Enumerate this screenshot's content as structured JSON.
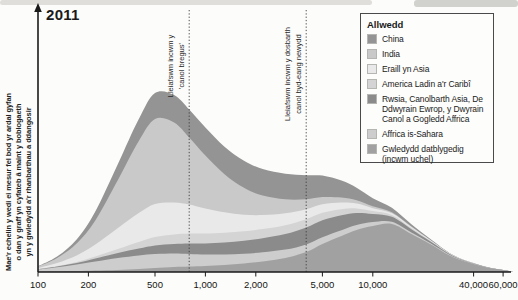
{
  "page": {
    "year_label": "2011"
  },
  "y_axis_note": {
    "lines": [
      "Mae'r echelin y wedi ei mesur fel bod yr ardal gyfan",
      "o dan y graff yn cyfateb â maint y boblogaeth",
      "yn y gwledydd a'r rhanbarthau a ddangosir"
    ]
  },
  "annotations": [
    {
      "lines": [
        "Lleiafswm incwm y",
        "'canol bregus'"
      ],
      "x_value": 800
    },
    {
      "lines": [
        "Lleiafswm incwm y dosbarth",
        "canol byd-eang newydd"
      ],
      "x_value": 4000
    }
  ],
  "legend": {
    "title": "Allwedd",
    "items": [
      {
        "label": "China",
        "color": "#949494"
      },
      {
        "label": "India",
        "color": "#c9c9c9"
      },
      {
        "label": "Eraill yn Asia",
        "color": "#e9e9e9"
      },
      {
        "label": "America Ladin a'r Caribî",
        "color": "#d4d4d4"
      },
      {
        "label": "Rwsia, Canolbarth Asia, De Ddwyrain Ewrop, y Dwyrain Canol a Gogledd Affrica",
        "color": "#8b8b8b"
      },
      {
        "label": "Affrica is-Sahara",
        "color": "#cdcdcd"
      },
      {
        "label": "Gwledydd datblygedig (incwm uchel)",
        "color": "#a1a1a1"
      }
    ]
  },
  "chart_data": {
    "type": "area",
    "stacked": true,
    "stack_order": "bottom-to-top",
    "title": "2011",
    "x_scale": "log",
    "x_range": [
      100,
      70000
    ],
    "legend_position": "top-right",
    "grid": false,
    "x_ticks": {
      "values": [
        100,
        200,
        500,
        1000,
        2000,
        5000,
        10000,
        40000,
        60000
      ],
      "labels": [
        "100",
        "200",
        "500",
        "1,000",
        "2,000",
        "5,000",
        "10,000",
        "40,000",
        "60,000"
      ]
    },
    "threshold_values": [
      800,
      4000
    ],
    "x": [
      100,
      130,
      170,
      220,
      300,
      400,
      500,
      650,
      800,
      1000,
      1300,
      1700,
      2200,
      3000,
      4000,
      5000,
      6500,
      8000,
      10000,
      13000,
      17000,
      22000,
      30000,
      40000,
      50000,
      60000,
      70000
    ],
    "series": [
      {
        "name": "Gwledydd datblygedig (incwm uchel)",
        "color": "#a1a1a1",
        "values": [
          0.5,
          0.8,
          1,
          1.5,
          2,
          3,
          4,
          5,
          5.5,
          6,
          7,
          8.5,
          10.5,
          14,
          20,
          28,
          36,
          42,
          46,
          48,
          38,
          28,
          15,
          8,
          4,
          2,
          0
        ]
      },
      {
        "name": "Affrica is-Sahara",
        "color": "#cdcdcd",
        "values": [
          2,
          4,
          6.5,
          9,
          12,
          13.5,
          14,
          13.5,
          12.5,
          11.5,
          10.5,
          9.8,
          9.2,
          8.4,
          7.6,
          6.8,
          5.8,
          5,
          4,
          2.2,
          1.6,
          1,
          0.5,
          0.2,
          0.1,
          0,
          0
        ]
      },
      {
        "name": "Rwsia, Canolbarth Asia, De Ddwyrain Ewrop, y Dwyrain Canol a Gogledd Affrica",
        "color": "#8b8b8b",
        "values": [
          0.3,
          0.7,
          1.5,
          3,
          5,
          7,
          8.5,
          9.5,
          10.5,
          11,
          12,
          13,
          14,
          15.5,
          17,
          17,
          15,
          12,
          8,
          5,
          3.2,
          1.8,
          0.8,
          0.3,
          0.1,
          0,
          0
        ]
      },
      {
        "name": "America Ladin a'r Caribî",
        "color": "#d4d4d4",
        "values": [
          0.2,
          0.5,
          1,
          2,
          4,
          6.5,
          8.5,
          9.5,
          10,
          10,
          9.8,
          9.5,
          9.2,
          8.8,
          8.2,
          7.4,
          6,
          4.6,
          3,
          1.8,
          1.1,
          0.6,
          0.25,
          0.1,
          0,
          0,
          0
        ]
      },
      {
        "name": "Eraill yn Asia",
        "color": "#e9e9e9",
        "values": [
          1,
          3,
          6.5,
          12,
          21,
          29,
          33,
          32,
          29,
          25,
          20.5,
          16.5,
          14,
          12,
          10,
          8.5,
          6.6,
          4.8,
          2.8,
          1.8,
          1.1,
          0.6,
          0.25,
          0.1,
          0,
          0,
          0
        ]
      },
      {
        "name": "India",
        "color": "#c9c9c9",
        "values": [
          1.5,
          5,
          12,
          24,
          48,
          72,
          85,
          80,
          67,
          53,
          38,
          27,
          19.5,
          14,
          10,
          7.2,
          5,
          3.4,
          2,
          0.9,
          0.4,
          0.15,
          0,
          0,
          0,
          0,
          0
        ]
      },
      {
        "name": "China",
        "color": "#949494",
        "values": [
          0.3,
          1.5,
          4,
          9,
          16,
          22,
          26,
          27.5,
          28,
          28,
          27.5,
          27,
          26.5,
          25.5,
          24,
          21.5,
          17,
          12.5,
          8,
          4.5,
          2.4,
          1.2,
          0.4,
          0.15,
          0,
          0,
          0
        ]
      }
    ]
  }
}
